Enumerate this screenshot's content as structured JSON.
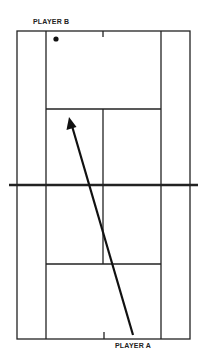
{
  "diagram": {
    "type": "tennis-court-shot-diagram",
    "labels": {
      "player_b": "PLAYER B",
      "player_a": "PLAYER A"
    },
    "colors": {
      "line": "#222222",
      "background": "#ffffff"
    },
    "court": {
      "outer": {
        "x1": 17,
        "y1": 31,
        "x2": 190,
        "y2": 339
      },
      "singles_left_x": 46,
      "singles_right_x": 161,
      "center_service_x": 103,
      "service_line_top_y": 109,
      "service_line_bottom_y": 264,
      "net": {
        "x1": 9,
        "x2": 198,
        "y": 185
      }
    },
    "player_b_marker": {
      "x": 56,
      "y": 39
    },
    "shot_arrow": {
      "from": {
        "x": 133,
        "y": 335
      },
      "to": {
        "x": 69,
        "y": 117
      }
    }
  }
}
